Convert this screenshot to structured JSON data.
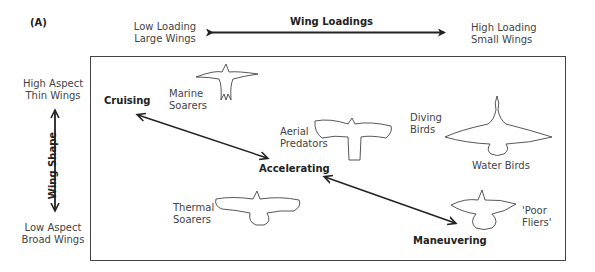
{
  "panel_label": "(A)",
  "top_axis": {
    "title": "Wing Loadings",
    "left_label": [
      "Low Loading",
      "Large Wings"
    ],
    "right_label": [
      "High Loading",
      "Small Wings"
    ]
  },
  "side_axis": {
    "title": "Wing Shape",
    "top_label": [
      "High Aspect",
      "Thin Wings"
    ],
    "bottom_label": [
      "Low Aspect",
      "Broad Wings"
    ]
  },
  "flight_modes": {
    "cruising": "Cruising",
    "accelerating": "Accelerating",
    "maneuvering": "Maneuvering"
  },
  "bird_groups": [
    {
      "id": "marine-soarers",
      "label": [
        "Marine",
        "Soarers"
      ]
    },
    {
      "id": "aerial-predators",
      "label": [
        "Aerial",
        "Predators"
      ]
    },
    {
      "id": "diving-birds",
      "label": [
        "Diving",
        "Birds"
      ]
    },
    {
      "id": "water-birds",
      "label": [
        "Water Birds"
      ]
    },
    {
      "id": "thermal-soarers",
      "label": [
        "Thermal",
        "Soarers"
      ]
    },
    {
      "id": "poor-fliers",
      "label": [
        "'Poor",
        "Fliers'"
      ]
    }
  ],
  "colors": {
    "line": "#222222",
    "text": "#444444",
    "frame": "#444444"
  }
}
